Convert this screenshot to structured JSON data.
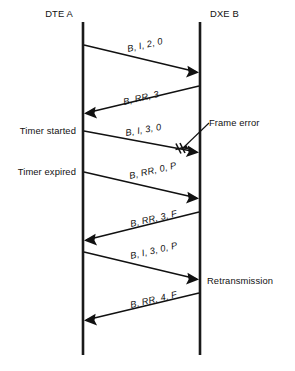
{
  "diagram": {
    "type": "sequence-diagram",
    "title": "",
    "participants": [
      {
        "id": "dte-a",
        "label": "DTE A",
        "x": 83
      },
      {
        "id": "dxe-b",
        "label": "DXE B",
        "x": 200
      }
    ],
    "lifeline": {
      "top": 22,
      "bottom": 355
    },
    "messages": [
      {
        "id": "msg-1",
        "label": "B, I, 2, 0",
        "direction": "left-to-right",
        "from_y": 45,
        "to_y": 72,
        "label_x": 128,
        "label_y": 52,
        "rotation": -13,
        "error": false
      },
      {
        "id": "msg-2",
        "label": "B, RR, 3",
        "direction": "right-to-left",
        "from_y": 86,
        "to_y": 113,
        "label_x": 124,
        "label_y": 105,
        "rotation": -13,
        "error": false
      },
      {
        "id": "msg-3",
        "label": "B, I, 3, 0",
        "direction": "left-to-right",
        "from_y": 131,
        "to_y": 152,
        "label_x": 126,
        "label_y": 136,
        "rotation": -10,
        "error": true
      },
      {
        "id": "msg-4",
        "label": "B, RR, 0, P",
        "direction": "left-to-right",
        "from_y": 172,
        "to_y": 198,
        "label_x": 130,
        "label_y": 179,
        "rotation": -13,
        "error": false
      },
      {
        "id": "msg-5",
        "label": "B, RR, 3, F",
        "direction": "right-to-left",
        "from_y": 212,
        "to_y": 240,
        "label_x": 131,
        "label_y": 227,
        "rotation": -13,
        "error": false
      },
      {
        "id": "msg-6",
        "label": "B, I, 3, 0, P",
        "direction": "left-to-right",
        "from_y": 252,
        "to_y": 279,
        "label_x": 131,
        "label_y": 259,
        "rotation": -13,
        "error": false
      },
      {
        "id": "msg-7",
        "label": "B, RR, 4, F",
        "direction": "right-to-left",
        "from_y": 293,
        "to_y": 320,
        "label_x": 131,
        "label_y": 308,
        "rotation": -13,
        "error": false
      }
    ],
    "annotations": [
      {
        "id": "timer-started",
        "label": "Timer started",
        "side": "left",
        "x": 76,
        "y": 131
      },
      {
        "id": "timer-expired",
        "label": "Timer expired",
        "side": "left",
        "x": 76,
        "y": 172
      },
      {
        "id": "frame-error",
        "label": "Frame error",
        "side": "right",
        "x": 211,
        "y": 126,
        "leader": {
          "x1": 209,
          "y1": 124,
          "x2": 184,
          "y2": 148
        }
      },
      {
        "id": "retransmission",
        "label": "Retransmission",
        "side": "right",
        "x": 208,
        "y": 281
      }
    ],
    "colors": {
      "line": "#111111",
      "lifeline": "#1a1a1a",
      "background": "#ffffff",
      "text": "#111111"
    }
  }
}
